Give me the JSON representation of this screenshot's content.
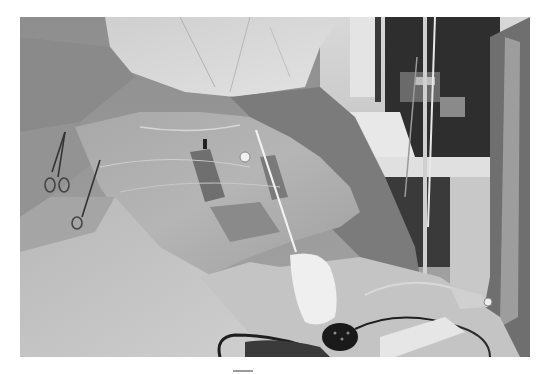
{
  "image": {
    "description": "Grayscale photograph of a surgical procedure: a patient's body covered with sterile drapes and a transparent adhesive film, towel clamps on the left, a thin probe/needle inserted at center with a white gauze pad below, cables and a handheld device in the foreground, and operating-room equipment (IV pole, monitors, cart) in the background.",
    "palette": {
      "background": "#ffffff",
      "drape_dark": "#7d7d7d",
      "drape_mid": "#9c9c9c",
      "drape_light": "#c8c8c8",
      "gown": "#d6d6d6",
      "gauze": "#eeeeee",
      "equipment_dark": "#2a2a2a",
      "mark": "#9a9a9a"
    }
  }
}
